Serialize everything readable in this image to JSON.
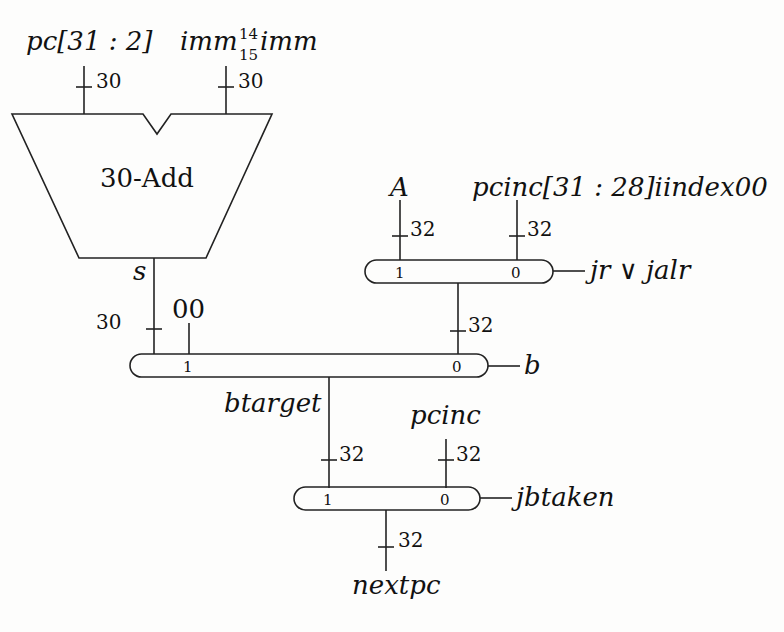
{
  "adder": {
    "label": "30-Add",
    "input_a": "pc[31 : 2]",
    "input_b_base": "imm",
    "input_b_sup": "14",
    "input_b_sub": "15",
    "input_b_tail": "imm",
    "input_a_width": "30",
    "input_b_width": "30",
    "output_label": "s",
    "output_width": "30"
  },
  "mux_jr": {
    "input1": "A",
    "input0": "pcinc[31 : 28]iindex00",
    "input1_width": "32",
    "input0_width": "32",
    "sel1": "1",
    "sel0": "0",
    "select": "jr ∨ jalr",
    "output_width": "32"
  },
  "mux_b": {
    "extra_input": "00",
    "sel1": "1",
    "sel0": "0",
    "select": "b",
    "output_label": "btarget"
  },
  "mux_jb": {
    "input0": "pcinc",
    "input1_width": "32",
    "input0_width": "32",
    "sel1": "1",
    "sel0": "0",
    "select": "jbtaken",
    "output_width": "32",
    "output_label": "nextpc"
  }
}
